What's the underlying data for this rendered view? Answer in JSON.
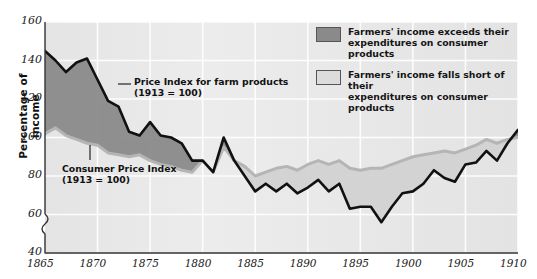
{
  "axes": {
    "ylabel": "Percentage of income",
    "yticks": [
      160,
      140,
      120,
      100,
      80,
      60,
      40
    ],
    "xticks": [
      1865,
      1870,
      1875,
      1880,
      1885,
      1890,
      1895,
      1900,
      1905,
      1910
    ],
    "ylim": [
      40,
      160
    ],
    "xlim": [
      1865,
      1910
    ],
    "axis_break": true,
    "grid": true
  },
  "legend": {
    "items": [
      {
        "swatch_color": "#8a8a8a",
        "line1": "Farmers' income exceeds their",
        "line2": "expenditures on consumer products"
      },
      {
        "swatch_color": "#dcdcdc",
        "line1": "Farmers' income falls short of their",
        "line2": "expenditures on consumer products"
      }
    ]
  },
  "annotations": {
    "farm": {
      "line1": "Price Index for farm products",
      "line2": "(1913 = 100)"
    },
    "cpi": {
      "line1": "Consumer Price Index",
      "line2": "(1913 = 100)"
    }
  },
  "colors": {
    "plot_background": "#e9e9e9",
    "grid": "#fdfdfd",
    "farm_line": "#111111",
    "cpi_line": "#b5b5b5",
    "fill_above": "#8a8a8a",
    "fill_below": "#d2d2d2",
    "axis": "#333333"
  },
  "chart_data": {
    "type": "line",
    "title": "",
    "xlabel": "",
    "ylabel": "Percentage of income",
    "xlim": [
      1865,
      1910
    ],
    "ylim": [
      40,
      160
    ],
    "grid": true,
    "legend_position": "top-right",
    "x": [
      1865,
      1866,
      1867,
      1868,
      1869,
      1870,
      1871,
      1872,
      1873,
      1874,
      1875,
      1876,
      1877,
      1878,
      1879,
      1880,
      1881,
      1882,
      1883,
      1884,
      1885,
      1886,
      1887,
      1888,
      1889,
      1890,
      1891,
      1892,
      1893,
      1894,
      1895,
      1896,
      1897,
      1898,
      1899,
      1900,
      1901,
      1902,
      1903,
      1904,
      1905,
      1906,
      1907,
      1908,
      1909,
      1910
    ],
    "series": [
      {
        "name": "Price Index for farm products (1913 = 100)",
        "color": "#111111",
        "values": [
          145,
          140,
          134,
          139,
          141,
          130,
          119,
          116,
          103,
          101,
          108,
          101,
          100,
          97,
          88,
          88,
          82,
          100,
          88,
          80,
          72,
          76,
          72,
          76,
          71,
          74,
          78,
          72,
          76,
          63,
          64,
          64,
          56,
          64,
          71,
          72,
          76,
          83,
          79,
          77,
          86,
          87,
          93,
          88,
          97,
          104
        ]
      },
      {
        "name": "Consumer Price Index (1913 = 100)",
        "color": "#b5b5b5",
        "values": [
          102,
          105,
          101,
          99,
          97,
          96,
          92,
          91,
          90,
          91,
          88,
          86,
          85,
          83,
          82,
          88,
          82,
          95,
          88,
          85,
          80,
          82,
          84,
          85,
          83,
          86,
          88,
          86,
          88,
          84,
          83,
          84,
          84,
          86,
          88,
          90,
          91,
          92,
          93,
          92,
          94,
          96,
          99,
          97,
          99,
          100
        ]
      }
    ],
    "fill_between": {
      "above_label": "Farmers' income exceeds their expenditures on consumer products",
      "above_color": "#8a8a8a",
      "below_label": "Farmers' income falls short of their expenditures on consumer products",
      "below_color": "#d2d2d2"
    }
  }
}
